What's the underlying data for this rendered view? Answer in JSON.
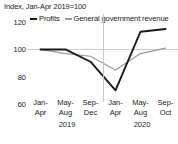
{
  "chart_data": {
    "type": "line",
    "title": "Index, Jan-Apr 2019=100",
    "xlabel": "",
    "ylabel": "",
    "ylim": [
      60,
      126
    ],
    "yticks": [
      60,
      80,
      100,
      120
    ],
    "ytick_labels": [
      "60",
      "80",
      "100",
      "120"
    ],
    "grid": false,
    "reference_line": 100,
    "legend_position": "top",
    "categories": [
      "Jan-Apr",
      "May-Aug",
      "Sep-Dec",
      "Jan-Apr",
      "May-Aug",
      "Sep-Oct"
    ],
    "category_lines": [
      [
        "Jan-",
        "Apr"
      ],
      [
        "May-",
        "Aug"
      ],
      [
        "Sep-",
        "Dec"
      ],
      [
        "Jan-",
        "Apr"
      ],
      [
        "May-",
        "Aug"
      ],
      [
        "Sep-",
        "Oct"
      ]
    ],
    "group_labels": [
      "2019",
      "2020"
    ],
    "series": [
      {
        "name": "Profits",
        "color": "#1a1a1a",
        "values": [
          100,
          100,
          91,
          70,
          113,
          115
        ]
      },
      {
        "name": "General government revenue",
        "color": "#9a9a9a",
        "values": [
          100,
          97,
          95,
          85,
          97,
          101
        ]
      }
    ]
  },
  "legend": {
    "items": [
      {
        "label": "Profits",
        "swatch": "profits"
      },
      {
        "label": "General government revenue",
        "swatch": "revenue"
      }
    ]
  }
}
